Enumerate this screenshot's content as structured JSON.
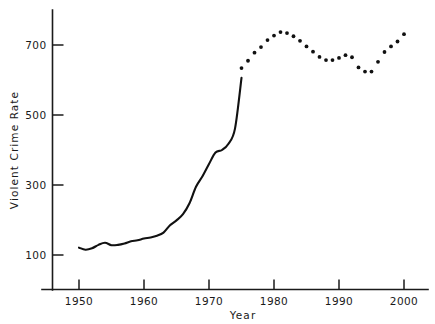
{
  "chart_data": {
    "type": "line",
    "title": "",
    "xlabel": "Year",
    "ylabel": "Violent Crime Rate",
    "xlim": [
      1946,
      2001
    ],
    "ylim": [
      30,
      775
    ],
    "grid": false,
    "legend": "none",
    "xticks": [
      1950,
      1960,
      1970,
      1980,
      1990,
      2000
    ],
    "xticklabels": [
      "1950",
      "1960",
      "1970",
      "1980",
      "1990",
      "2000"
    ],
    "yticks": [
      100,
      300,
      500,
      700
    ],
    "yticklabels": [
      "100",
      "300",
      "500",
      "700"
    ],
    "series": [
      {
        "name": "Violent crime rate (solid line segment)",
        "style": "solid-line",
        "x": [
          1950,
          1951,
          1952,
          1953,
          1954,
          1955,
          1956,
          1957,
          1958,
          1959,
          1960,
          1961,
          1962,
          1963,
          1964,
          1965,
          1966,
          1967,
          1968,
          1969,
          1970,
          1971,
          1972,
          1973,
          1974
        ],
        "values": [
          121,
          115,
          119,
          129,
          135,
          128,
          129,
          133,
          139,
          142,
          147,
          150,
          155,
          164,
          185,
          199,
          217,
          248,
          295,
          325,
          360,
          393,
          400,
          418,
          461
        ]
      },
      {
        "name": "Violent crime rate (dotted marker segment)",
        "style": "dots",
        "x": [
          1975,
          1976,
          1977,
          1978,
          1979,
          1980,
          1981,
          1982,
          1983,
          1984,
          1985,
          1986,
          1987,
          1988,
          1989,
          1990,
          1991,
          1992,
          1993,
          1994,
          1995,
          1996,
          1997,
          1998,
          1999,
          2000
        ],
        "values": [
          634,
          655,
          678,
          694,
          714,
          727,
          737,
          734,
          725,
          712,
          696,
          681,
          666,
          657,
          657,
          663,
          671,
          665,
          636,
          624,
          624,
          652,
          680,
          696,
          710,
          731
        ]
      }
    ],
    "line_break_note": "Solid line runs 1950-1974 and rises to approximately 606 at its right end; dotted markers cover 1975-2000."
  },
  "axes": {
    "y_axis_label": "Violent Crime Rate",
    "x_axis_label": "Year"
  }
}
